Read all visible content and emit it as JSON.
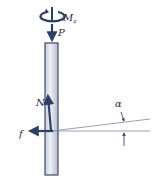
{
  "diagram": {
    "labels": {
      "moment": "M",
      "moment_subscript": "z",
      "axial_load": "P",
      "normal_force": "N",
      "friction": "f",
      "angle": "α"
    },
    "colors": {
      "arrow": "#2c3e6b",
      "post_fill": "#e4e6ee",
      "post_stroke": "#3a4a70",
      "guide_line": "#7a8aa8",
      "text": "#2a2a3a"
    }
  }
}
